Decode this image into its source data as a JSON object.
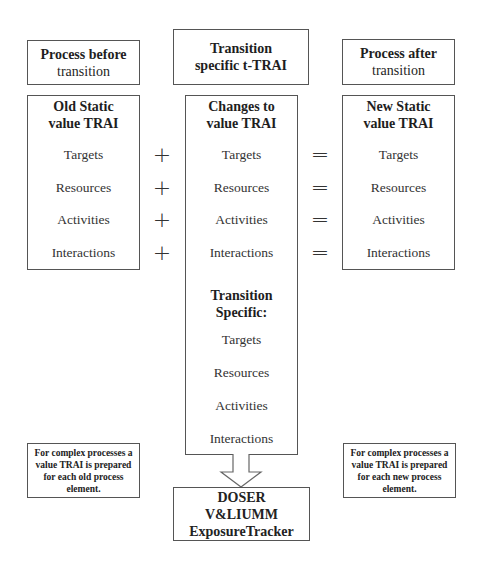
{
  "headers": {
    "before": [
      "Process before",
      "transition"
    ],
    "transition": [
      "Transition",
      "specific t-TRAI"
    ],
    "after": [
      "Process  after",
      "transition"
    ]
  },
  "columns": {
    "old": {
      "title": [
        "Old Static",
        "value TRAI"
      ],
      "items": [
        "Targets",
        "Resources",
        "Activities",
        "Interactions"
      ]
    },
    "changes": {
      "title": [
        "Changes to",
        "value TRAI"
      ],
      "items": [
        "Targets",
        "Resources",
        "Activities",
        "Interactions"
      ],
      "subtitle": [
        "Transition",
        "Specific:"
      ],
      "specific_items": [
        "Targets",
        "Resources",
        "Activities",
        "Interactions"
      ]
    },
    "new": {
      "title": [
        "New Static",
        "value TRAI"
      ],
      "items": [
        "Targets",
        "Resources",
        "Activities",
        "Interactions"
      ]
    }
  },
  "operators": {
    "plus": "+",
    "equals": "="
  },
  "notes": {
    "left": "For complex processes a value TRAI is prepared for each old process element.",
    "right": "For complex processes a value TRAI is prepared for each new process element."
  },
  "output_box": [
    "DOSER",
    "V&LIUMM",
    "ExposureTracker"
  ]
}
